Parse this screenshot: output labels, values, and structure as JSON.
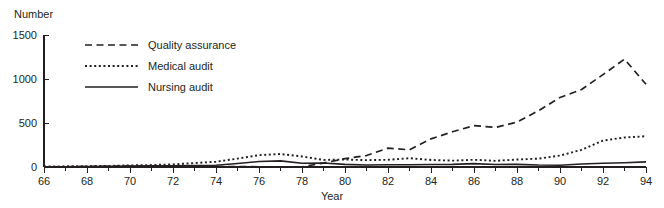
{
  "chart_data": {
    "type": "line",
    "title": "",
    "xlabel": "Year",
    "ylabel": "Number",
    "xlim": [
      66,
      94
    ],
    "ylim": [
      0,
      1500
    ],
    "grid": false,
    "legend_position": "upper-left-inside",
    "x_tick_labels": [
      "66",
      "68",
      "70",
      "72",
      "74",
      "76",
      "78",
      "80",
      "82",
      "84",
      "86",
      "88",
      "90",
      "92",
      "94"
    ],
    "x_ticks": [
      66,
      68,
      70,
      72,
      74,
      76,
      78,
      80,
      82,
      84,
      86,
      88,
      90,
      92,
      94
    ],
    "x_minor_ticks": [
      67,
      69,
      71,
      73,
      75,
      77,
      79,
      81,
      83,
      85,
      87,
      89,
      91,
      93
    ],
    "y_tick_labels": [
      "0",
      "500",
      "1000",
      "1500"
    ],
    "y_ticks": [
      0,
      500,
      1000,
      1500
    ],
    "x": [
      66,
      67,
      68,
      69,
      70,
      71,
      72,
      73,
      74,
      75,
      76,
      77,
      78,
      79,
      80,
      81,
      82,
      83,
      84,
      85,
      86,
      87,
      88,
      89,
      90,
      91,
      92,
      93,
      94
    ],
    "series": [
      {
        "name": "Quality assurance",
        "style": "dashed",
        "values": [
          2,
          3,
          5,
          8,
          10,
          10,
          8,
          6,
          5,
          4,
          3,
          2,
          2,
          45,
          95,
          130,
          215,
          195,
          320,
          400,
          470,
          450,
          510,
          640,
          790,
          880,
          1050,
          1225,
          940
        ]
      },
      {
        "name": "Medical audit",
        "style": "dotted",
        "values": [
          5,
          8,
          10,
          12,
          18,
          22,
          30,
          45,
          60,
          95,
          135,
          148,
          120,
          80,
          85,
          78,
          82,
          100,
          80,
          72,
          82,
          70,
          85,
          95,
          130,
          195,
          300,
          335,
          350
        ]
      },
      {
        "name": "Nursing audit",
        "style": "solid",
        "values": [
          2,
          3,
          5,
          8,
          12,
          14,
          15,
          16,
          20,
          40,
          62,
          70,
          42,
          45,
          30,
          22,
          25,
          26,
          28,
          30,
          38,
          28,
          30,
          22,
          20,
          34,
          42,
          48,
          58
        ]
      }
    ]
  },
  "legend": {
    "items": [
      {
        "label": "Quality assurance",
        "style": "dashed"
      },
      {
        "label": "Medical audit",
        "style": "dotted"
      },
      {
        "label": "Nursing audit",
        "style": "solid"
      }
    ]
  },
  "colors": {
    "ink": "#231f20",
    "background": "#ffffff"
  }
}
